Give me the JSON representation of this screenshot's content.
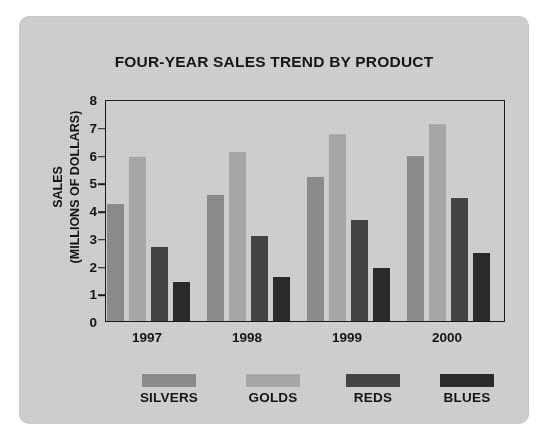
{
  "chart_data": {
    "type": "bar",
    "title": "FOUR-YEAR SALES TREND BY PRODUCT",
    "xlabel": "",
    "ylabel": "SALES",
    "ylabel_line2": "(MILLIONS OF DOLLARS)",
    "categories": [
      "1997",
      "1998",
      "1999",
      "2000"
    ],
    "series": [
      {
        "name": "SILVERS",
        "color": "#8e8e8e",
        "values": [
          4.2,
          4.55,
          5.2,
          5.95
        ]
      },
      {
        "name": "GOLDS",
        "color": "#ababab",
        "values": [
          5.9,
          6.1,
          6.75,
          7.1
        ]
      },
      {
        "name": "REDS",
        "color": "#454545",
        "values": [
          2.65,
          3.05,
          3.65,
          4.45
        ]
      },
      {
        "name": "BLUES",
        "color": "#2b2b2b",
        "values": [
          1.4,
          1.6,
          1.9,
          2.45
        ]
      }
    ],
    "ylim": [
      0,
      8
    ],
    "y_ticks": [
      "0",
      "1",
      "2",
      "3",
      "4",
      "5",
      "6",
      "7",
      "8"
    ],
    "grid": false,
    "legend_position": "bottom",
    "legend_entries": [
      "SILVERS",
      "GOLDS",
      "REDS",
      "BLUES"
    ]
  },
  "style": {
    "card_background": "#d3d3d3",
    "axis_color": "#1b1b1b",
    "text_color": "#151515",
    "page_background": "#ffffff"
  }
}
